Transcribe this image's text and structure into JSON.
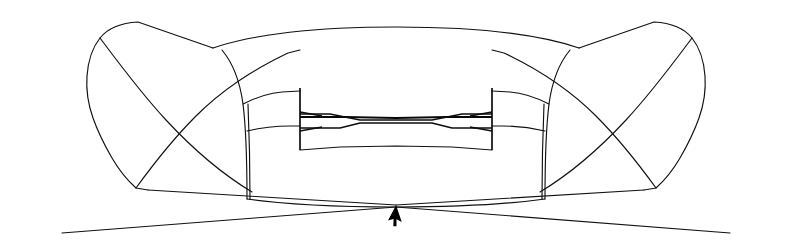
{
  "canvas": {
    "width": 792,
    "height": 247,
    "background_color": "#ffffff",
    "stroke_color": "#111111",
    "title": "Wireframe Model Viewport"
  },
  "cursor": {
    "name": "mouse-pointer",
    "shape": "arrow",
    "color": "#000000",
    "x": 397,
    "y": 206,
    "rotation_deg": 28
  },
  "model": {
    "name": "symmetric-bowtie-bracket-wireframe",
    "description": "Orthographic wireframe of a symmetric hourglass / bowtie shaped bracket with a central shaft, two flange tabs and flared wings at each end.",
    "symmetry": "mirror about vertical axis x=396",
    "edge_count": 24,
    "projection": "orthographic"
  },
  "geometry": {
    "top_arc": "M 213,48 C 260,32 330,27 396,27 C 462,27 532,32 579,48",
    "bottom_arc": "M 247,199 C 290,205 345,207 396,207 C 447,207 502,205 545,199",
    "left_wing_outer": "M 213,48 L 138,22 C 120,23 108,28 100,38 C 92,48 88,62 87,76 C 86,90 88,104 93,118 C 98,132 105,146 112,158 C 119,170 127,180 136,188 L 148,190",
    "right_wing_outer": "M 579,48 L 654,22 C 672,23 684,28 692,38 C 700,48 704,62 705,76 C 706,90 704,104 699,118 C 694,132 687,146 680,158 C 673,170 665,180 656,188 L 644,190",
    "left_wing_cross_upper": "M 136,188 C 152,166 172,140 196,116 C 220,92 252,70 288,53 L 300,50",
    "left_wing_cross_lower": "M 100,38 C 118,62 140,92 166,120 C 192,148 222,174 252,192",
    "right_wing_cross_upper": "M 656,188 C 640,166 620,140 596,116 C 572,92 540,70 504,53 L 492,50",
    "right_wing_cross_lower": "M 692,38 C 674,62 652,92 626,120 C 600,148 570,174 540,192",
    "left_lower_ray_a": "M 148,190 L 396,205",
    "left_lower_ray_b": "M 62,233 L 396,207",
    "right_lower_ray_a": "M 644,190 L 396,205",
    "right_lower_ray_b": "M 730,233 L 396,207",
    "left_body_drop_outer": "M 222,50 C 232,62 240,82 243,104 C 246,128 247,162 247,199",
    "left_body_drop_inner": "M 248,104 C 249,128 250,162 250,199",
    "right_body_drop_outer": "M 570,50 C 560,62 552,82 549,104 C 546,128 545,162 545,199",
    "right_body_drop_inner": "M 544,104 C 543,128 542,162 542,199",
    "left_flange_top_curve": "M 243,104 C 255,98 268,93 282,92 L 300,91",
    "left_flange_mid_curve": "M 247,131 C 260,128 275,126 290,126 L 300,126",
    "right_flange_top_curve": "M 549,104 C 537,98 524,93 510,92 L 492,91",
    "right_flange_mid_curve": "M 545,131 C 532,128 517,126 502,126 L 492,126",
    "left_flange_vertical": "M 300,88 L 300,150",
    "right_flange_vertical": "M 492,88 L 492,150",
    "shaft_top_edge": "M 300,117 L 345,117 L 396,118 L 447,117 L 492,117",
    "shaft_upper_edge": "M 300,114 L 330,114 L 360,120 L 432,120 L 462,114 L 492,114",
    "shaft_mid_edge": "M 300,128 L 340,128 L 360,123 L 432,123 L 452,128 L 492,128",
    "shaft_bottom_edge": "M 300,150 L 340,147 L 396,146 L 452,147 L 492,150",
    "left_shaft_taper_top": "M 300,112 L 322,116",
    "left_shaft_taper_bot": "M 300,131 L 322,127",
    "right_shaft_taper_top": "M 492,112 L 470,116",
    "right_shaft_taper_bot": "M 492,131 L 470,127"
  }
}
